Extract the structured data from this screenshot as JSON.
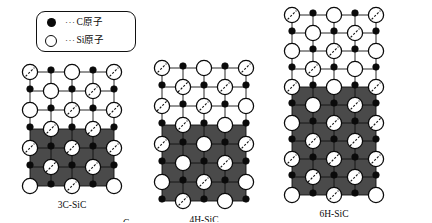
{
  "legend": {
    "entries": [
      {
        "symbol": "filled-circle",
        "leader": "···",
        "label": "C原子"
      },
      {
        "symbol": "open-circle",
        "leader": "···",
        "label": "Si原子"
      }
    ]
  },
  "colors": {
    "carbon": "#0a0a0a",
    "silicon_fill": "#ffffff",
    "silicon_stroke": "#0a0a0a",
    "shaded_region": "#4a4a4a",
    "unshaded_region": "#ffffff",
    "grid_line": "#111111",
    "bond_dashed": "#111111",
    "text": "#0a0a0a"
  },
  "structures": [
    {
      "id": "3c-sic",
      "caption": "3C-SiC",
      "layer_labels": [
        "C",
        "B",
        "A",
        "C",
        "B",
        "A"
      ],
      "stacking_period": 3,
      "columns": 4,
      "rows": 6,
      "shaded_from_row": 3,
      "cell_w": 21,
      "cell_h": 19,
      "origin_x": 30,
      "origin_y": 72,
      "si_radius": 7.6,
      "c_radius": 3.3,
      "bond_shift": 1
    },
    {
      "id": "4h-sic",
      "caption": "4H-SiC",
      "layer_labels": [
        "C",
        "B",
        "A",
        "B",
        "C",
        "B",
        "A"
      ],
      "stacking_period": 4,
      "columns": 4,
      "rows": 7,
      "shaded_from_row": 3,
      "cell_w": 21,
      "cell_h": 19,
      "origin_x": 162,
      "origin_y": 68,
      "si_radius": 7.6,
      "c_radius": 3.3,
      "bond_shift": 1
    },
    {
      "id": "6h-sic",
      "caption": "6H-SiC",
      "layer_labels": [
        "A",
        "C",
        "B",
        "A",
        "B",
        "C",
        "A",
        "C",
        "B",
        "A"
      ],
      "stacking_period": 6,
      "columns": 4,
      "rows": 10,
      "shaded_from_row": 4,
      "cell_w": 21,
      "cell_h": 18,
      "origin_x": 292,
      "origin_y": 15,
      "si_radius": 7.6,
      "c_radius": 3.3,
      "bond_shift": 1
    }
  ]
}
